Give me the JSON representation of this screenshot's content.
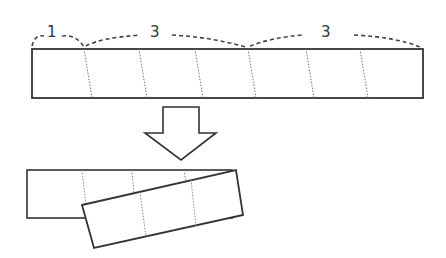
{
  "diagram": {
    "top_strip": {
      "segments": 7,
      "labels": [
        {
          "text": "1",
          "x": 52,
          "y": 36
        },
        {
          "text": "3",
          "x": 155,
          "y": 36
        },
        {
          "text": "3",
          "x": 326,
          "y": 36
        }
      ]
    },
    "arrow": {
      "direction": "down",
      "style": "outlined"
    },
    "result": {
      "description": "Folded strip with rotated overlapping part",
      "back_segments": 4,
      "front_segments": 3
    },
    "colors": {
      "line": "#333333",
      "dotted": "#777777",
      "background": "#ffffff"
    }
  }
}
